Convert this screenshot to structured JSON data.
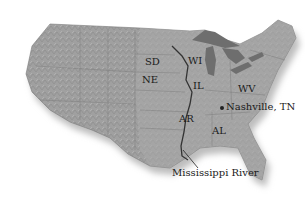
{
  "map": {
    "title": "United States relief map",
    "colors": {
      "land": "#9a9a9a",
      "land_light": "#b3b3b3",
      "water_lakes": "#6e6e6e",
      "river": "#3a3a3a",
      "shadow": "#c8c8c8",
      "label": "#1a1a1a"
    },
    "labels": {
      "sd": "SD",
      "ne": "NE",
      "wi": "WI",
      "il": "IL",
      "wv": "WV",
      "ar": "AR",
      "al": "AL",
      "nashville": "Nashville, TN",
      "river": "Mississippi River"
    }
  }
}
